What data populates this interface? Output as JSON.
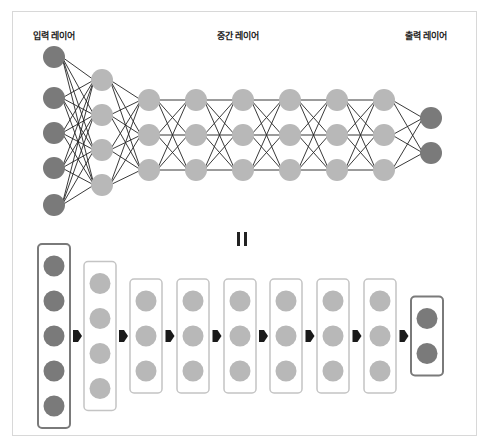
{
  "labels": {
    "input_layer": "입력 레이어",
    "hidden_layer": "중간 레이어",
    "output_layer": "출력 레이어",
    "equals": "II"
  },
  "colors": {
    "input_node": "#7a7a7a",
    "hidden_node": "#b8b8b8",
    "output_node": "#7a7a7a",
    "edge": "#222222",
    "input_box_border": "#7a7a7a",
    "hidden_box_border": "#c4c4c4",
    "arrow": "#1a1a1a",
    "frame_border": "#d8d8d8"
  },
  "network": {
    "layers": [
      {
        "type": "input",
        "nodes": 5
      },
      {
        "type": "hidden",
        "nodes": 4
      },
      {
        "type": "hidden",
        "nodes": 3
      },
      {
        "type": "hidden",
        "nodes": 3
      },
      {
        "type": "hidden",
        "nodes": 3
      },
      {
        "type": "hidden",
        "nodes": 3
      },
      {
        "type": "hidden",
        "nodes": 3
      },
      {
        "type": "hidden",
        "nodes": 3
      },
      {
        "type": "output",
        "nodes": 2
      }
    ]
  }
}
